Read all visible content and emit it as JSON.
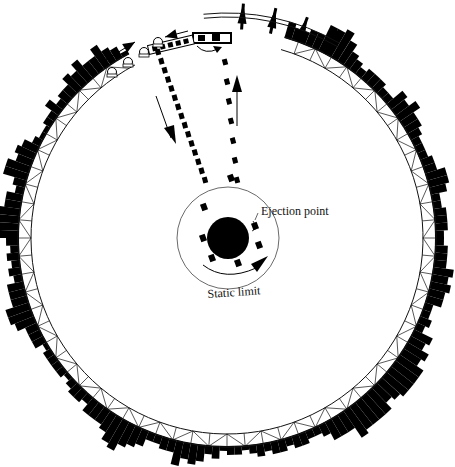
{
  "diagram": {
    "type": "circular station plan (orbital ring habitat)",
    "center": [
      227,
      238
    ],
    "colors": {
      "ink": "#000000",
      "background": "#ffffff",
      "line": "#1a1a1a"
    },
    "labels": {
      "ejection_point": "Ejection point",
      "static_limit": "Static limit"
    },
    "ring": {
      "truss_inner_radius": 196,
      "truss_outer_radius": 209,
      "truss_segments": 72
    },
    "hub": {
      "radius": 21
    },
    "static_limit_circle": {
      "radius": 51
    },
    "trajectories": [
      {
        "name": "outbound-dotted-path",
        "from": [
          158,
          52
        ],
        "to": [
          205,
          180
        ]
      },
      {
        "name": "return-dotted-path",
        "from": [
          225,
          62
        ],
        "to": [
          237,
          180
        ]
      }
    ],
    "icons": [
      "hub-disc",
      "rocket-tower-icon",
      "vehicle-icon",
      "direction-arrow-icon",
      "dock-crane-icon",
      "truss-ring",
      "building-silhouette"
    ]
  }
}
